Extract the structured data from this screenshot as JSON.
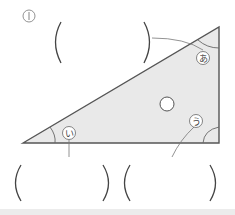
{
  "problem": {
    "number": "1",
    "number_glyph": "①"
  },
  "triangle": {
    "fill": "#e9e9e9",
    "stroke": "#555555",
    "vertices": {
      "left": [
        23,
        143
      ],
      "top_right": [
        219,
        27
      ],
      "bottom_right": [
        219,
        143
      ]
    },
    "right_angle_at": "bottom_right"
  },
  "angles": [
    {
      "id": "a",
      "label": "あ",
      "vertex": "top_right"
    },
    {
      "id": "i",
      "label": "い",
      "vertex": "left"
    },
    {
      "id": "u",
      "label": "う",
      "vertex": "bottom_right"
    }
  ],
  "center_marker": "○",
  "answer_boxes": [
    {
      "for": "あ",
      "open": "(",
      "close": ")",
      "value": ""
    },
    {
      "for": "い",
      "open": "(",
      "close": ")",
      "value": ""
    },
    {
      "for": "う",
      "open": "(",
      "close": ")",
      "value": ""
    }
  ]
}
